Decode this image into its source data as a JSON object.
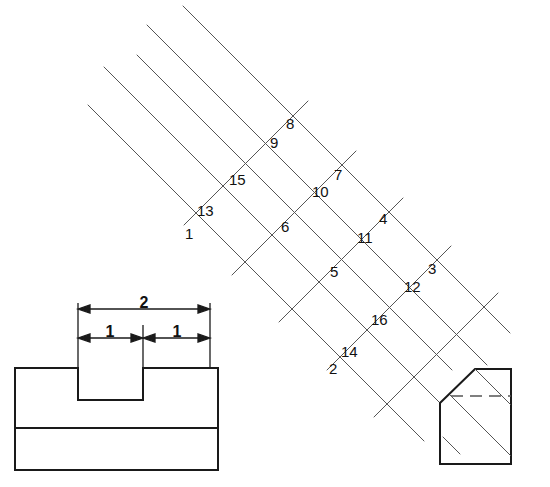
{
  "drawing": {
    "title": "Isometric block with T-slot and chamfered end",
    "background_color": "#ffffff",
    "line_color": "#555555",
    "solid_edge_color": "#1a1a1a",
    "text_color": "#111111",
    "width": 550,
    "height": 487
  },
  "front_view": {
    "name": "front-view",
    "dimensions": {
      "overall": "2",
      "left_half": "1",
      "right_half": "1"
    }
  },
  "pictorial_view": {
    "name": "pictorial-view",
    "surface_labels": [
      {
        "id": "1",
        "x": 185,
        "y": 239
      },
      {
        "id": "2",
        "x": 329,
        "y": 374
      },
      {
        "id": "3",
        "x": 428,
        "y": 274
      },
      {
        "id": "4",
        "x": 379,
        "y": 224
      },
      {
        "id": "5",
        "x": 330,
        "y": 277
      },
      {
        "id": "6",
        "x": 281,
        "y": 232
      },
      {
        "id": "7",
        "x": 334,
        "y": 180
      },
      {
        "id": "8",
        "x": 286,
        "y": 129
      },
      {
        "id": "9",
        "x": 270,
        "y": 148
      },
      {
        "id": "10",
        "x": 317,
        "y": 197
      },
      {
        "id": "11",
        "x": 361,
        "y": 243
      },
      {
        "id": "12",
        "x": 408,
        "y": 292
      },
      {
        "id": "13",
        "x": 201,
        "y": 216
      },
      {
        "id": "14",
        "x": 345,
        "y": 357
      },
      {
        "id": "15",
        "x": 234,
        "y": 185
      },
      {
        "id": "16",
        "x": 375,
        "y": 325
      }
    ]
  }
}
